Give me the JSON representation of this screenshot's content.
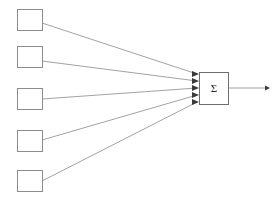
{
  "diagram": {
    "type": "block-diagram",
    "canvas": {
      "width": 280,
      "height": 206,
      "background": "#ffffff"
    },
    "colors": {
      "box_stroke": "#8c8c8c",
      "sum_box_stroke": "#6e6e6e",
      "edge_stroke": "#8a8a8a",
      "arrow_fill": "#3a3a3a",
      "fill": "#ffffff"
    },
    "input_nodes": [
      {
        "id": "input-1",
        "label": "",
        "x": 17,
        "y": 9,
        "width": 25,
        "height": 21
      },
      {
        "id": "input-2",
        "label": "",
        "x": 17,
        "y": 46,
        "width": 25,
        "height": 21
      },
      {
        "id": "input-3",
        "label": "",
        "x": 17,
        "y": 88,
        "width": 25,
        "height": 21
      },
      {
        "id": "input-4",
        "label": "",
        "x": 17,
        "y": 130,
        "width": 25,
        "height": 21
      },
      {
        "id": "input-5",
        "label": "",
        "x": 17,
        "y": 170,
        "width": 25,
        "height": 21
      }
    ],
    "sum_node": {
      "id": "sum-node",
      "symbol": "Σ",
      "x": 199,
      "y": 72,
      "width": 29,
      "height": 33
    },
    "edges": [
      {
        "id": "edge-1",
        "from": "input-1",
        "to": "sum-node",
        "x1": 42,
        "y1": 23,
        "x2": 197,
        "y2": 74
      },
      {
        "id": "edge-2",
        "from": "input-2",
        "to": "sum-node",
        "x1": 42,
        "y1": 61,
        "x2": 197,
        "y2": 81
      },
      {
        "id": "edge-3",
        "from": "input-3",
        "to": "sum-node",
        "x1": 42,
        "y1": 99,
        "x2": 197,
        "y2": 88
      },
      {
        "id": "edge-4",
        "from": "input-4",
        "to": "sum-node",
        "x1": 42,
        "y1": 140,
        "x2": 197,
        "y2": 95
      },
      {
        "id": "edge-5",
        "from": "input-5",
        "to": "sum-node",
        "x1": 42,
        "y1": 181,
        "x2": 197,
        "y2": 102
      }
    ],
    "output_edge": {
      "id": "output-edge",
      "from": "sum-node",
      "x1": 228,
      "y1": 88,
      "x2": 266,
      "y2": 88
    }
  }
}
